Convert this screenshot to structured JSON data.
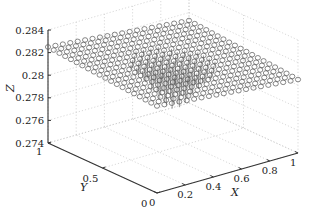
{
  "chart_data": {
    "type": "scatter",
    "subtype": "3d-stem",
    "title": "",
    "xlabel": "X",
    "ylabel": "Y",
    "zlabel": "Z",
    "xlim": [
      0,
      1
    ],
    "ylim": [
      0,
      1
    ],
    "zlim": [
      0.274,
      0.284
    ],
    "x_ticks": [
      "0",
      "0.2",
      "0.4",
      "0.6",
      "0.8",
      "1"
    ],
    "y_ticks": [
      "0",
      "0.5",
      "1"
    ],
    "z_ticks": [
      "0.274",
      "0.276",
      "0.278",
      "0.28",
      "0.282",
      "0.284"
    ],
    "grid": true,
    "marker": "circle",
    "grid_points": 20,
    "base_level": 0.2815,
    "slope_x": -0.0012,
    "slope_y": 0.0008,
    "center_dip": {
      "x": 0.5,
      "y": 0.5,
      "depth": 0.004,
      "radius": 0.17
    }
  },
  "axes": {
    "x_label": "X",
    "y_label": "Y",
    "z_label": "Z"
  }
}
